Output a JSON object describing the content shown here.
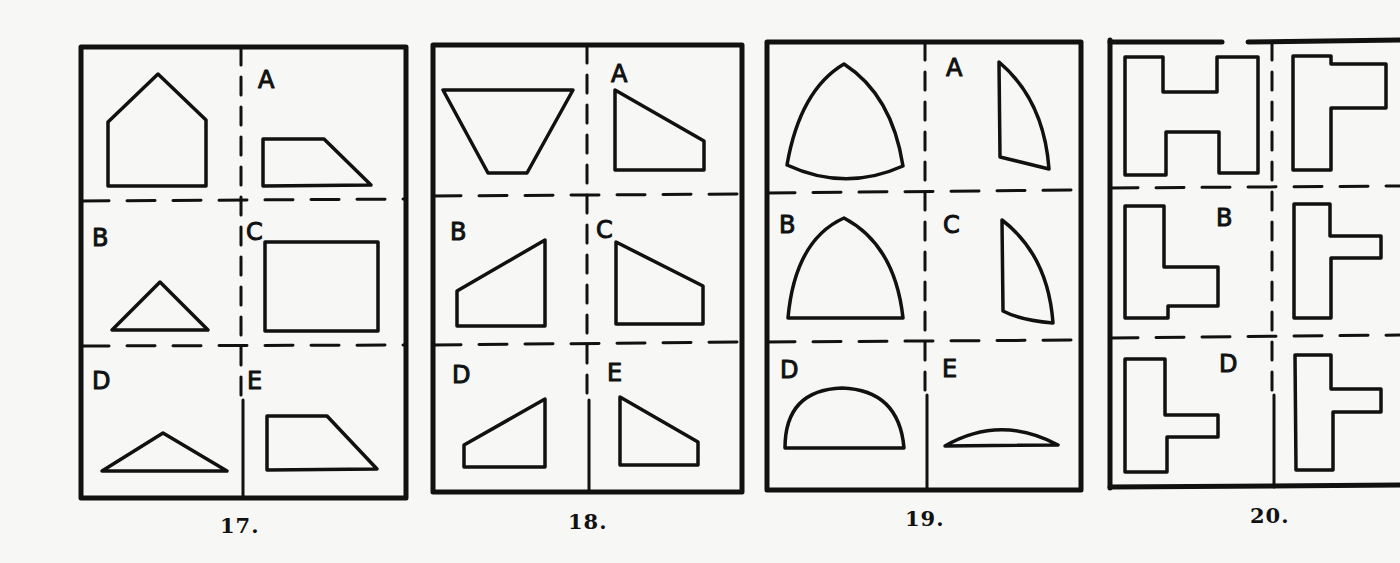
{
  "document": {
    "type": "spatial-reasoning puzzle page (scanned)",
    "puzzles": [
      {
        "number": "17.",
        "given_shape": "pentagon (house shape)",
        "options": [
          {
            "label": "A",
            "shape": "right trapezoid (slanted right side)"
          },
          {
            "label": "B",
            "shape": "isosceles triangle"
          },
          {
            "label": "C",
            "shape": "rectangle"
          },
          {
            "label": "D",
            "shape": "obtuse wide triangle"
          },
          {
            "label": "E",
            "shape": "right trapezoid (taller)"
          }
        ]
      },
      {
        "number": "18.",
        "given_shape": "inverted trapezoid",
        "options": [
          {
            "label": "A",
            "shape": "quadrilateral slanting down-right"
          },
          {
            "label": "B",
            "shape": "quadrilateral slanting up-right"
          },
          {
            "label": "C",
            "shape": "quadrilateral slanting down-right"
          },
          {
            "label": "D",
            "shape": "quadrilateral slanting up-right (small)"
          },
          {
            "label": "E",
            "shape": "quadrilateral slanting down-right (small)"
          }
        ]
      },
      {
        "number": "19.",
        "given_shape": "Reuleaux-like curved triangle",
        "options": [
          {
            "label": "A",
            "shape": "curved sliver (right half)"
          },
          {
            "label": "B",
            "shape": "curved arch with flat base"
          },
          {
            "label": "C",
            "shape": "curved sliver (right half)"
          },
          {
            "label": "D",
            "shape": "semicircle-like dome"
          },
          {
            "label": "E",
            "shape": "thin lens segment"
          }
        ]
      },
      {
        "number": "20.",
        "given_shape": "H shape",
        "options": [
          {
            "label": "",
            "shape": "F-like block shape"
          },
          {
            "label": "B",
            "shape": "L-like block shape"
          },
          {
            "label": "",
            "shape": "T-like sideways block"
          },
          {
            "label": "D",
            "shape": "T-like sideways block"
          },
          {
            "label": "",
            "shape": "T-like sideways block"
          }
        ]
      }
    ]
  },
  "labels": {
    "p17": {
      "A": "A",
      "B": "B",
      "C": "C",
      "D": "D",
      "E": "E",
      "num": "17."
    },
    "p18": {
      "A": "A",
      "B": "B",
      "C": "C",
      "D": "D",
      "E": "E",
      "num": "18."
    },
    "p19": {
      "A": "A",
      "B": "B",
      "C": "C",
      "D": "D",
      "E": "E",
      "num": "19."
    },
    "p20": {
      "B": "B",
      "D": "D",
      "num": "20."
    }
  },
  "colors": {
    "ink": "#111111",
    "paper": "#f7f7f5"
  }
}
